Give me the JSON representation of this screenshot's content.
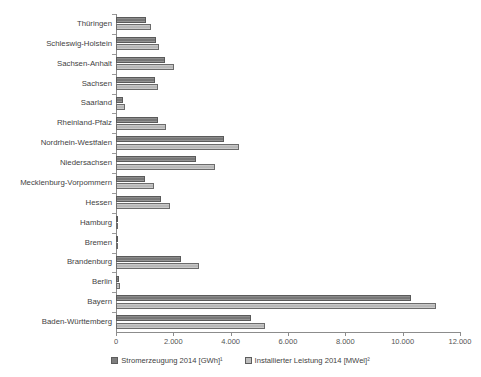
{
  "chart_data": {
    "type": "bar",
    "orientation": "horizontal",
    "title": "",
    "subtitle": "",
    "xlabel": "",
    "ylabel": "",
    "xlim": [
      0,
      12000
    ],
    "xticks": [
      "0",
      "2.000",
      "4.000",
      "6.000",
      "8.000",
      "10.000",
      "12.000"
    ],
    "xtick_values": [
      0,
      2000,
      4000,
      6000,
      8000,
      10000,
      12000
    ],
    "grid": false,
    "legend_position": "bottom",
    "categories": [
      "Thüringen",
      "Schleswig-Holstein",
      "Sachsen-Anhalt",
      "Sachsen",
      "Saarland",
      "Rheinland-Pfalz",
      "Nordrhein-Westfalen",
      "Niedersachsen",
      "Mecklenburg-Vorpommern",
      "Hessen",
      "Hamburg",
      "Bremen",
      "Brandenburg",
      "Berlin",
      "Bayern",
      "Baden-Württemberg"
    ],
    "series": [
      {
        "name": "Stromerzeugung 2014 [GWh]¹",
        "color": "#7e7e7e",
        "values": [
          1050,
          1390,
          1700,
          1350,
          230,
          1470,
          3750,
          2800,
          1010,
          1570,
          30,
          25,
          2260,
          110,
          10300,
          4700
        ]
      },
      {
        "name": "Installierter Leistung 2014 [MWel]²",
        "color": "#bdbdbd",
        "values": [
          1230,
          1500,
          2030,
          1470,
          300,
          1740,
          4300,
          3470,
          1310,
          1870,
          40,
          30,
          2900,
          130,
          11150,
          5200
        ]
      }
    ]
  },
  "legend": {
    "items": [
      {
        "label": "Stromerzeugung 2014 [GWh]¹",
        "swatch": "s1"
      },
      {
        "label": "Installierter Leistung 2014 [MWel]²",
        "swatch": "s2"
      }
    ]
  }
}
